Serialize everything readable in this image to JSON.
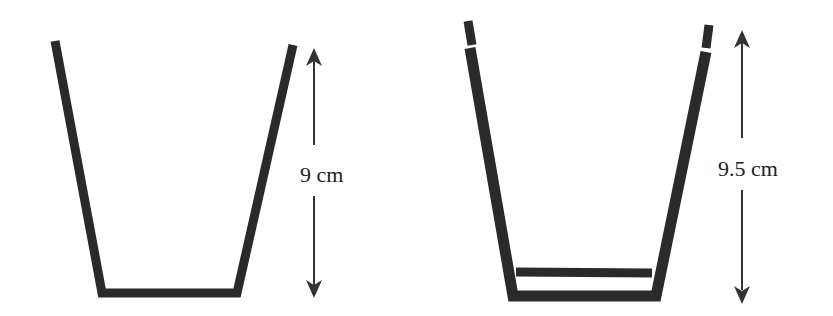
{
  "figure": {
    "colors": {
      "stroke": "#2a2a2a",
      "arrow": "#333333",
      "text": "#222222",
      "background": "#ffffff"
    },
    "cups": [
      {
        "name": "single-cup",
        "height_label": "9 cm"
      },
      {
        "name": "stacked-cups",
        "height_label": "9.5 cm"
      }
    ]
  }
}
